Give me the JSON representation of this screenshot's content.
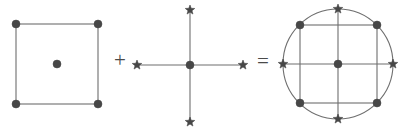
{
  "figure": {
    "canvas": {
      "width": 406,
      "height": 130,
      "background": "#ffffff"
    },
    "style": {
      "line_color": "#6e6e6e",
      "line_width": 1.1,
      "dot_color": "#474747",
      "star_color": "#474747",
      "operator_color": "#4a4a4a",
      "dot_radius": 4.0,
      "center_dot_radius": 4.0,
      "star_radius": 5.0
    },
    "operators": [
      {
        "name": "plus",
        "symbol": "+",
        "x": 120,
        "y": 61
      },
      {
        "name": "equals",
        "symbol": "=",
        "x": 263,
        "y": 62
      }
    ],
    "terms": [
      {
        "name": "square-term",
        "kind": "square",
        "square": {
          "left": 16,
          "top": 24,
          "right": 98,
          "bottom": 104
        },
        "dots": [
          {
            "label": "top-left",
            "x": 16,
            "y": 24
          },
          {
            "label": "top-right",
            "x": 98,
            "y": 24
          },
          {
            "label": "bottom-left",
            "x": 16,
            "y": 104
          },
          {
            "label": "bottom-right",
            "x": 98,
            "y": 104
          },
          {
            "label": "center",
            "x": 57,
            "y": 64
          }
        ],
        "stars": [],
        "circle": null
      },
      {
        "name": "cross-term",
        "kind": "cross",
        "cross": {
          "cx": 190,
          "cy": 65,
          "arm_h": 53,
          "arm_v": 57
        },
        "dots": [
          {
            "label": "center",
            "x": 190,
            "y": 65
          }
        ],
        "stars": [
          {
            "label": "left",
            "x": 137,
            "y": 65
          },
          {
            "label": "right",
            "x": 243,
            "y": 65
          },
          {
            "label": "top",
            "x": 190,
            "y": 10
          },
          {
            "label": "bottom",
            "x": 190,
            "y": 122
          }
        ],
        "circle": null
      },
      {
        "name": "result-term",
        "kind": "circle-square-cross",
        "circle": {
          "cx": 338,
          "cy": 64,
          "r": 55
        },
        "square": {
          "left": 300,
          "top": 25,
          "right": 377,
          "bottom": 103
        },
        "cross": {
          "cx": 338,
          "cy": 64,
          "arm_h": 55,
          "arm_v": 55
        },
        "dots": [
          {
            "label": "top-left",
            "x": 300,
            "y": 25
          },
          {
            "label": "top-right",
            "x": 377,
            "y": 25
          },
          {
            "label": "bottom-left",
            "x": 300,
            "y": 103
          },
          {
            "label": "bottom-right",
            "x": 377,
            "y": 103
          },
          {
            "label": "center",
            "x": 338,
            "y": 64
          }
        ],
        "stars": [
          {
            "label": "left",
            "x": 283,
            "y": 64
          },
          {
            "label": "right",
            "x": 393,
            "y": 64
          },
          {
            "label": "top",
            "x": 338,
            "y": 9
          },
          {
            "label": "bottom",
            "x": 338,
            "y": 119
          }
        ]
      }
    ]
  }
}
